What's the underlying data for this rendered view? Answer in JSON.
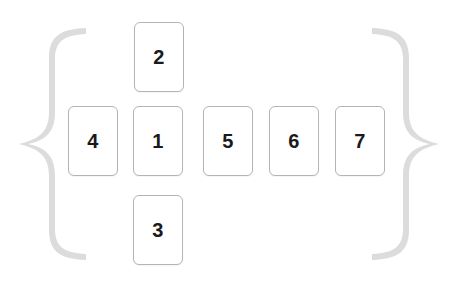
{
  "diagram": {
    "background_color": "#ffffff",
    "card_style": {
      "fill": "#ffffff",
      "border_color": "#b4b4b4",
      "text_color": "#1a1a1a",
      "corner_radius_px": 6
    },
    "brace_color": "#dcdcdc",
    "braces": {
      "left": {
        "glyph": "{",
        "name": "left-curly-brace"
      },
      "right": {
        "glyph": "}",
        "name": "right-curly-brace"
      }
    },
    "cards": [
      {
        "label": "2",
        "name": "card-2",
        "x": 134,
        "y": 22,
        "w": 50,
        "h": 70,
        "position": "top"
      },
      {
        "label": "4",
        "name": "card-4",
        "x": 68,
        "y": 106,
        "w": 50,
        "h": 70,
        "position": "middle-left"
      },
      {
        "label": "1",
        "name": "card-1",
        "x": 133,
        "y": 106,
        "w": 50,
        "h": 70,
        "position": "center"
      },
      {
        "label": "5",
        "name": "card-5",
        "x": 203,
        "y": 106,
        "w": 50,
        "h": 70,
        "position": "middle-right-1"
      },
      {
        "label": "6",
        "name": "card-6",
        "x": 269,
        "y": 106,
        "w": 50,
        "h": 70,
        "position": "middle-right-2"
      },
      {
        "label": "7",
        "name": "card-7",
        "x": 335,
        "y": 106,
        "w": 50,
        "h": 70,
        "position": "middle-right-3"
      },
      {
        "label": "3",
        "name": "card-3",
        "x": 133,
        "y": 195,
        "w": 50,
        "h": 70,
        "position": "bottom"
      }
    ]
  }
}
